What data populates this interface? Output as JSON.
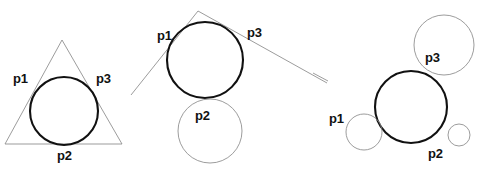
{
  "figure": {
    "width": 484,
    "height": 177,
    "background_color": "#ffffff",
    "stroke_dark": "#111111",
    "stroke_light": "#8a8a8a",
    "panels": [
      {
        "id": "panel-left",
        "description": "Incircle of a triangle: circle tangent to three straight lines",
        "shapes": [
          {
            "name": "triangle",
            "type": "polygon",
            "style": "light",
            "points": [
              [
                62,
                40
              ],
              [
                122,
                144
              ],
              [
                5,
                144
              ]
            ]
          },
          {
            "name": "incircle",
            "type": "circle",
            "style": "dark",
            "cx": 64,
            "cy": 111,
            "r": 34
          }
        ],
        "labels": [
          {
            "name": "label-p1",
            "text": "p1",
            "x": 13,
            "y": 72
          },
          {
            "name": "label-p3",
            "text": "p3",
            "x": 96,
            "y": 72
          },
          {
            "name": "label-p2",
            "text": "p2",
            "x": 57,
            "y": 149
          }
        ]
      },
      {
        "id": "panel-middle",
        "description": "Circle tangent to two lines and one circle",
        "shapes": [
          {
            "name": "tangent-line-left",
            "type": "line",
            "style": "light",
            "x1": 198,
            "y1": 11,
            "x2": 131,
            "y2": 95
          },
          {
            "name": "tangent-line-right",
            "type": "line",
            "style": "light",
            "x1": 198,
            "y1": 11,
            "x2": 327,
            "y2": 83
          },
          {
            "name": "main-circle",
            "type": "circle",
            "style": "dark",
            "cx": 205,
            "cy": 60,
            "r": 38
          },
          {
            "name": "tangent-circle-bottom",
            "type": "circle",
            "style": "light",
            "cx": 210,
            "cy": 131,
            "r": 32
          }
        ],
        "labels": [
          {
            "name": "label-p1",
            "text": "p1",
            "x": 157,
            "y": 29
          },
          {
            "name": "label-p3",
            "text": "p3",
            "x": 247,
            "y": 26
          },
          {
            "name": "label-p2",
            "text": "p2",
            "x": 195,
            "y": 109
          }
        ]
      },
      {
        "id": "panel-right",
        "description": "Circle tangent to three circles of differing radii",
        "shapes": [
          {
            "name": "stray-line",
            "type": "line",
            "style": "light",
            "x1": 313,
            "y1": 73,
            "x2": 328,
            "y2": 81
          },
          {
            "name": "tangent-circle-p3",
            "type": "circle",
            "style": "light",
            "cx": 444,
            "cy": 45,
            "r": 30
          },
          {
            "name": "main-circle",
            "type": "circle",
            "style": "dark",
            "cx": 411,
            "cy": 107,
            "r": 36
          },
          {
            "name": "tangent-circle-p1",
            "type": "circle",
            "style": "light",
            "cx": 364,
            "cy": 132,
            "r": 18
          },
          {
            "name": "tangent-circle-p2",
            "type": "circle",
            "style": "light",
            "cx": 459,
            "cy": 135,
            "r": 11
          }
        ],
        "labels": [
          {
            "name": "label-p1",
            "text": "p1",
            "x": 329,
            "y": 112
          },
          {
            "name": "label-p3",
            "text": "p3",
            "x": 425,
            "y": 51
          },
          {
            "name": "label-p2",
            "text": "p2",
            "x": 428,
            "y": 147
          }
        ]
      }
    ]
  }
}
